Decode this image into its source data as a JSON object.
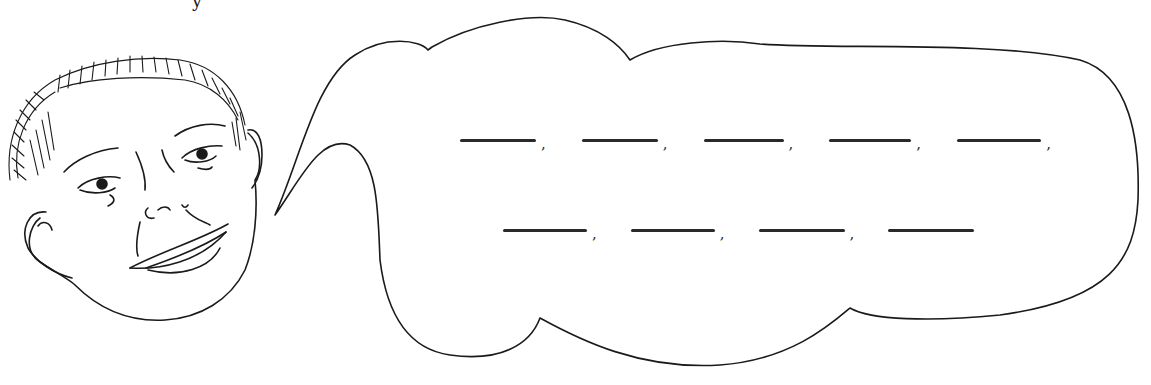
{
  "scene": {
    "description": "Hand-drawn boy's face with speech bubble containing fill-in blanks",
    "stroke_color": "#1a1a1a",
    "background": "#ffffff"
  },
  "top_fragment": {
    "text": "y"
  },
  "speech_bubble": {
    "rows": [
      {
        "blanks": [
          {
            "value": "",
            "width": 76,
            "punct": ","
          },
          {
            "value": "",
            "width": 76,
            "punct": ","
          },
          {
            "value": "",
            "width": 80,
            "punct": ","
          },
          {
            "value": "",
            "width": 82,
            "punct": ","
          },
          {
            "value": "",
            "width": 84,
            "punct": ","
          }
        ]
      },
      {
        "blanks": [
          {
            "value": "",
            "width": 84,
            "punct": ","
          },
          {
            "value": "",
            "width": 84,
            "punct": ","
          },
          {
            "value": "",
            "width": 86,
            "punct": ","
          },
          {
            "value": "",
            "width": 86,
            "punct": ""
          }
        ]
      }
    ]
  }
}
